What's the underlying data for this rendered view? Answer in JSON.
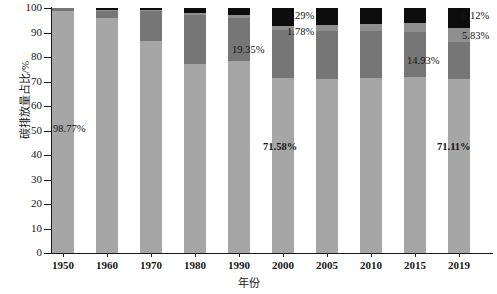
{
  "chart_data": {
    "type": "bar",
    "stacked": true,
    "title": "",
    "xlabel": "年份",
    "ylabel": "碳排放量占比/%",
    "ylim": [
      0,
      100
    ],
    "yticks": [
      0,
      10,
      20,
      30,
      40,
      50,
      60,
      70,
      80,
      90,
      100
    ],
    "ytick_labels": [
      "0",
      "10",
      "20",
      "30",
      "40",
      "50",
      "60",
      "70",
      "80",
      "90",
      "100"
    ],
    "grid": false,
    "legend": "none",
    "categories": [
      "1950",
      "1960",
      "1970",
      "1980",
      "1990",
      "2000",
      "2005",
      "2010",
      "2015",
      "2019"
    ],
    "series": [
      {
        "name": "series-1",
        "color": "#a6a6a6",
        "values": [
          98.77,
          95.8,
          86.5,
          77.0,
          78.3,
          71.58,
          71.0,
          71.5,
          72.0,
          71.11
        ]
      },
      {
        "name": "series-2",
        "color": "#767676",
        "values": [
          1.23,
          3.3,
          12.3,
          20.0,
          17.5,
          19.35,
          19.7,
          19.3,
          18.4,
          14.93
        ]
      },
      {
        "name": "series-3",
        "color": "#8f8f8f",
        "values": [
          0.0,
          0.2,
          0.4,
          1.0,
          1.5,
          1.78,
          2.2,
          2.6,
          3.4,
          5.83
        ]
      },
      {
        "name": "series-4",
        "color": "#0d0d0d",
        "values": [
          0.0,
          0.7,
          0.8,
          2.0,
          2.7,
          7.29,
          7.1,
          6.6,
          6.2,
          8.12
        ]
      }
    ],
    "annotations": [
      {
        "id": "a1950",
        "text": "98.77%",
        "x_px": 53,
        "y_px": 124,
        "bold": false
      },
      {
        "id": "a2000-top",
        "text": "7.29%",
        "x_px": 287,
        "y_px": 11,
        "bold": false
      },
      {
        "id": "a2000-mid",
        "text": "1.78%",
        "x_px": 287,
        "y_px": 27,
        "bold": false
      },
      {
        "id": "a2000-dark",
        "text": "19.35%",
        "x_px": 232,
        "y_px": 45,
        "bold": false
      },
      {
        "id": "a2000-base",
        "text": "71.58%",
        "x_px": 263,
        "y_px": 142,
        "bold": true
      },
      {
        "id": "a2019-top",
        "text": "8.12%",
        "x_px": 462,
        "y_px": 11,
        "bold": false
      },
      {
        "id": "a2019-mid",
        "text": "5.83%",
        "x_px": 462,
        "y_px": 31,
        "bold": false
      },
      {
        "id": "a2019-dark",
        "text": "14.93%",
        "x_px": 407,
        "y_px": 56,
        "bold": false
      },
      {
        "id": "a2019-base",
        "text": "71.11%",
        "x_px": 437,
        "y_px": 142,
        "bold": true
      }
    ]
  },
  "layout": {
    "plot_left_px": 52,
    "plot_top_px": 8,
    "plot_width_px": 438,
    "plot_height_px": 245,
    "bar_width_px": 22,
    "bar_pitch_px": 44,
    "bar_first_left_px": 52
  }
}
